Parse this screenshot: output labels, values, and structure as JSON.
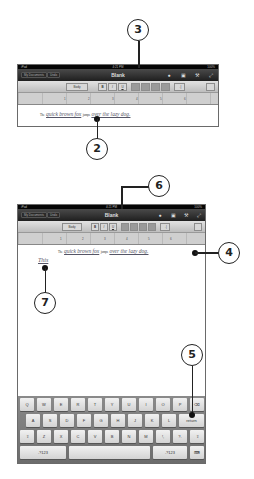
{
  "screenshots": [
    {
      "id": "before",
      "statusbar": {
        "carrier": "iPad",
        "time": "4:21 PM",
        "battery": "100%"
      },
      "navbar": {
        "my_documents_label": "My Documents",
        "undo_label": "Undo",
        "title": "Blank",
        "icons": [
          "info-icon",
          "media-icon",
          "tools-icon",
          "fullscreen-icon"
        ]
      },
      "toolbar": {
        "style_label": "Body",
        "bold": "B",
        "italic": "I",
        "underline": "U",
        "align": [
          "align-left",
          "align-center",
          "align-right",
          "justify"
        ],
        "tab": "→|"
      },
      "ruler": {
        "marks": [
          "1",
          "2",
          "3",
          "4",
          "5",
          "6"
        ]
      },
      "document": {
        "line1": {
          "the": "The",
          "quick_brown_fox": "quick brown fox",
          "jumps": "jumps",
          "rest": "over the lazy dog."
        }
      }
    },
    {
      "id": "after",
      "statusbar": {
        "carrier": "iPad",
        "time": "4:21 PM",
        "battery": "100%"
      },
      "navbar": {
        "my_documents_label": "My Documents",
        "undo_label": "Undo",
        "title": "Blank"
      },
      "toolbar": {
        "style_label": "Body",
        "bold": "B",
        "italic": "I",
        "underline": "U",
        "tab": "→|"
      },
      "ruler": {
        "marks": [
          "1",
          "2",
          "3",
          "4",
          "5",
          "6"
        ]
      },
      "document": {
        "line1": {
          "the": "The",
          "quick_brown_fox": "quick brown fox",
          "jumps": "jumps",
          "rest": "over the lazy dog."
        },
        "typed_text": "This"
      },
      "keyboard": {
        "row1": [
          "Q",
          "W",
          "E",
          "R",
          "T",
          "Y",
          "U",
          "I",
          "O",
          "P",
          "⌫"
        ],
        "row2": [
          "A",
          "S",
          "D",
          "F",
          "G",
          "H",
          "J",
          "K",
          "L",
          "return"
        ],
        "row3": [
          "⇧",
          "Z",
          "X",
          "C",
          "V",
          "B",
          "N",
          "M",
          "!,",
          "?.",
          "⇧"
        ],
        "row4": [
          ".?123",
          "",
          ".?123",
          "⌨"
        ]
      }
    }
  ],
  "callouts": {
    "c2": "2",
    "c3": "3",
    "c4": "4",
    "c5": "5",
    "c6": "6",
    "c7": "7"
  }
}
